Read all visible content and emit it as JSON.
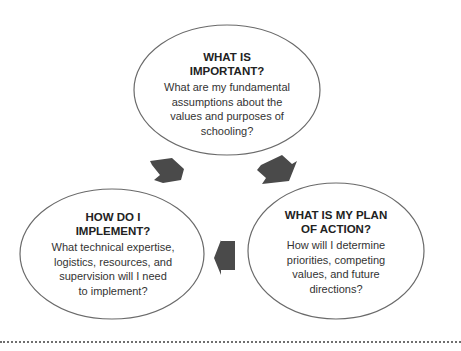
{
  "diagram": {
    "type": "cycle",
    "colors": {
      "outline": "#6a6a6a",
      "arrow_fill": "#4a4a4a",
      "text": "#2b2b2b",
      "rule": "#6f6f6f"
    },
    "nodes": [
      {
        "id": "important",
        "title_lines": [
          "WHAT IS",
          "IMPORTANT?"
        ],
        "body_lines": [
          "What are my fundamental",
          "assumptions about the",
          "values and purposes of",
          "schooling?"
        ]
      },
      {
        "id": "plan",
        "title_lines": [
          "WHAT IS MY PLAN",
          "OF ACTION?"
        ],
        "body_lines": [
          "How will I determine",
          "priorities, competing",
          "values, and future",
          "directions?"
        ]
      },
      {
        "id": "implement",
        "title_lines": [
          "HOW DO I",
          "IMPLEMENT?"
        ],
        "body_lines": [
          "What technical expertise,",
          "logistics, resources, and",
          "supervision will I need",
          "to implement?"
        ]
      }
    ],
    "edges": [
      {
        "from": "important",
        "to": "plan",
        "icon": "arrow-down-right"
      },
      {
        "from": "plan",
        "to": "implement",
        "icon": "arrow-left"
      },
      {
        "from": "implement",
        "to": "important",
        "icon": "arrow-up-left"
      }
    ]
  }
}
